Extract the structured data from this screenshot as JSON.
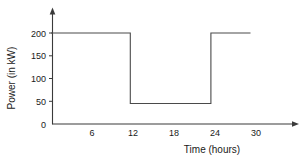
{
  "chart_data": {
    "type": "line",
    "title": "",
    "xlabel": "Time (hours)",
    "ylabel": "Power (in kW)",
    "xlim": [
      0,
      33
    ],
    "ylim": [
      0,
      215
    ],
    "grid": false,
    "legend": null,
    "x_ticks": [
      6,
      12,
      18,
      24,
      30
    ],
    "x_tick_labels": [
      "6",
      "12",
      "18",
      "24",
      "30"
    ],
    "y_ticks": [
      0,
      50,
      100,
      150,
      200
    ],
    "y_tick_labels": [
      "0",
      "50",
      "100",
      "150",
      "200"
    ],
    "series": [
      {
        "name": "Power",
        "step": "post",
        "x": [
          0,
          11.6,
          11.6,
          23.4,
          23.4,
          29.2
        ],
        "y": [
          200,
          200,
          45,
          45,
          200,
          200
        ],
        "points": [
          {
            "x": 0,
            "y": 200
          },
          {
            "x": 11.6,
            "y": 200
          },
          {
            "x": 11.6,
            "y": 45
          },
          {
            "x": 23.4,
            "y": 45
          },
          {
            "x": 23.4,
            "y": 200
          },
          {
            "x": 29.2,
            "y": 200
          }
        ]
      }
    ],
    "annotations": [
      {
        "kind": "axis-arrow",
        "axis": "y",
        "position": "top"
      },
      {
        "kind": "axis-arrow",
        "axis": "x",
        "position": "right"
      }
    ]
  },
  "axis": {
    "y_title": "Power (in kW)",
    "x_title": "Time (hours)",
    "y_labels": [
      "200",
      "150",
      "100",
      "50",
      "0"
    ],
    "x_labels": [
      "6",
      "12",
      "18",
      "24",
      "30"
    ]
  },
  "colors": {
    "background": "#ffffff",
    "axis": "#3a3a3a",
    "line": "#4a4a4a",
    "text": "#1a1a1a"
  }
}
